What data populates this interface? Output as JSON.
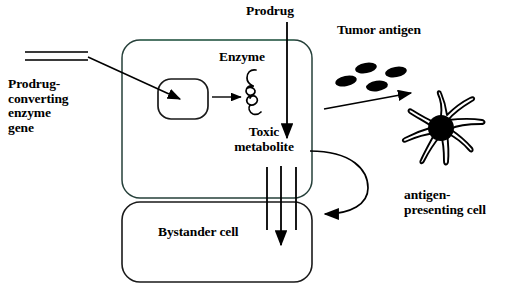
{
  "figure": {
    "type": "biological-schematic",
    "background_color": "#ffffff",
    "stroke_color": "#000000",
    "accent_color": "#5f7f6f"
  },
  "labels": {
    "prodrug": "Prodrug",
    "enzyme": "Enzyme",
    "toxic_metabolite": "Toxic\nmetabolite",
    "prodrug_converting_enzyme_gene": "Prodrug-\nconverting\nenzyme\ngene",
    "bystander_cell": "Bystander cell",
    "tumor_antigen": "Tumor antigen",
    "antigen_presenting_cell": "antigen-\npresenting cell"
  },
  "shapes": {
    "tumor_cell": {
      "name": "transduced-tumor-cell",
      "x": 122,
      "y": 40,
      "width": 190,
      "height": 158,
      "radius": 18
    },
    "bystander_cell": {
      "name": "bystander-cell",
      "x": 122,
      "y": 202,
      "width": 190,
      "height": 80,
      "radius": 18
    },
    "nucleus": {
      "name": "nucleus",
      "x": 158,
      "y": 79,
      "width": 50,
      "height": 40,
      "radius": 12
    },
    "gene_construct": {
      "name": "gene-construct-dna",
      "x1": 25,
      "x2": 88,
      "y_top": 52,
      "y_bottom": 60
    },
    "enzyme_squiggle": {
      "name": "enzyme-squiggle",
      "cx": 250,
      "cy": 92
    },
    "gap_junction": {
      "name": "gap-junction",
      "left_x": 266,
      "right_x": 296,
      "y_top": 168,
      "y_bottom": 228
    },
    "apc": {
      "name": "antigen-presenting-cell",
      "cx": 443,
      "cy": 130,
      "nucleus_r": 13,
      "arm_count": 6
    }
  },
  "tumor_antigens": {
    "name": "tumor-antigen-particles",
    "count": 4,
    "color": "#000000",
    "items": [
      {
        "cx": 346,
        "cy": 81,
        "rx": 11,
        "ry": 5.5,
        "rotate": -12
      },
      {
        "cx": 366,
        "cy": 69,
        "rx": 11,
        "ry": 5.5,
        "rotate": -10
      },
      {
        "cx": 377,
        "cy": 86,
        "rx": 11,
        "ry": 5.5,
        "rotate": -8
      },
      {
        "cx": 395,
        "cy": 73,
        "rx": 11,
        "ry": 5.5,
        "rotate": -10
      }
    ]
  },
  "arrows": [
    {
      "name": "gene-to-nucleus-arrow",
      "from": [
        88,
        57
      ],
      "to": [
        183,
        100
      ]
    },
    {
      "name": "nucleus-to-enzyme-arrow",
      "from": [
        213,
        97
      ],
      "to": [
        240,
        97
      ]
    },
    {
      "name": "prodrug-influx-arrow",
      "from": [
        287,
        22
      ],
      "to": [
        287,
        140
      ]
    },
    {
      "name": "toxic-metabolite-to-bystander-arrow",
      "from": [
        281,
        168
      ],
      "to": [
        281,
        247
      ]
    },
    {
      "name": "antigen-release-arrow",
      "from": [
        327,
        108
      ],
      "to": [
        412,
        93
      ]
    },
    {
      "name": "bystander-feedback-curved-arrow",
      "from": [
        313,
        152
      ],
      "to": [
        316,
        212
      ]
    }
  ]
}
